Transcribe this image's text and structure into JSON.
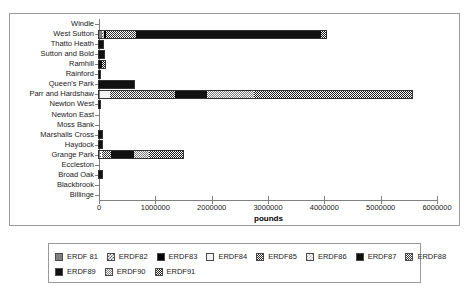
{
  "chart_data": {
    "type": "bar",
    "orientation": "horizontal",
    "stacked": true,
    "title": "",
    "xlabel": "pounds",
    "ylabel": "",
    "xlim": [
      0,
      6000000
    ],
    "xticks": [
      0,
      1000000,
      2000000,
      3000000,
      4000000,
      5000000,
      6000000
    ],
    "xtick_labels": [
      "0",
      "1000000",
      "2000000",
      "3000000",
      "4000000",
      "5000000",
      "6000000"
    ],
    "grid": false,
    "legend_position": "bottom",
    "categories": [
      "Windle",
      "West Sutton",
      "Thatto Heath",
      "Sutton and Bold",
      "Ramhill",
      "Rainford",
      "Queen's Park",
      "Parr and Hardshaw",
      "Newton West",
      "Newton East",
      "Moss Bank",
      "Marshalls Cross",
      "Haydock",
      "Grange Park",
      "Eccleston",
      "Broad Oak",
      "Blackbrook",
      "Billinge"
    ],
    "series": [
      {
        "name": "ERDF 81",
        "fill": "f-erdf81",
        "values": [
          0,
          60000,
          0,
          0,
          0,
          0,
          0,
          20000,
          0,
          0,
          0,
          0,
          0,
          18000,
          0,
          0,
          0,
          0
        ]
      },
      {
        "name": "ERDF82",
        "fill": "f-erdf82",
        "values": [
          0,
          30000,
          0,
          0,
          0,
          0,
          0,
          0,
          0,
          0,
          0,
          0,
          0,
          10000,
          0,
          0,
          0,
          0
        ]
      },
      {
        "name": "ERDF83",
        "fill": "f-erdf83",
        "values": [
          0,
          40000,
          0,
          0,
          0,
          0,
          0,
          0,
          0,
          0,
          0,
          0,
          0,
          0,
          0,
          0,
          0,
          0
        ]
      },
      {
        "name": "ERDF84",
        "fill": "f-erdf84",
        "values": [
          0,
          0,
          0,
          0,
          0,
          0,
          0,
          180000,
          0,
          0,
          0,
          0,
          0,
          25000,
          0,
          0,
          0,
          0
        ]
      },
      {
        "name": "ERDF85",
        "fill": "f-erdf85",
        "values": [
          0,
          250000,
          0,
          0,
          0,
          0,
          0,
          0,
          0,
          0,
          0,
          0,
          0,
          0,
          0,
          0,
          0,
          0
        ]
      },
      {
        "name": "ERDF86",
        "fill": "f-erdf86",
        "values": [
          0,
          0,
          0,
          0,
          0,
          0,
          0,
          0,
          0,
          0,
          0,
          0,
          0,
          0,
          0,
          0,
          0,
          0
        ]
      },
      {
        "name": "ERDF87",
        "fill": "f-erdf87",
        "values": [
          0,
          0,
          0,
          0,
          0,
          0,
          0,
          0,
          0,
          0,
          0,
          0,
          0,
          0,
          0,
          0,
          0,
          0
        ]
      },
      {
        "name": "ERDF88",
        "fill": "f-erdf88",
        "values": [
          0,
          270000,
          0,
          0,
          0,
          0,
          0,
          1150000,
          0,
          0,
          0,
          0,
          0,
          160000,
          0,
          0,
          0,
          0
        ]
      },
      {
        "name": "ERDF89",
        "fill": "f-erdf89",
        "values": [
          0,
          3300000,
          65000,
          90000,
          60000,
          20000,
          620000,
          560000,
          12000,
          0,
          0,
          55000,
          55000,
          400000,
          0,
          60000,
          0,
          0
        ]
      },
      {
        "name": "ERDF90",
        "fill": "f-erdf90",
        "values": [
          0,
          0,
          0,
          0,
          0,
          0,
          0,
          850000,
          0,
          0,
          0,
          0,
          0,
          280000,
          0,
          0,
          0,
          0
        ]
      },
      {
        "name": "ERDF91",
        "fill": "f-erdf91",
        "values": [
          0,
          80000,
          0,
          0,
          50000,
          0,
          0,
          2800000,
          0,
          0,
          0,
          0,
          0,
          590000,
          0,
          0,
          0,
          0
        ]
      }
    ],
    "totals": [
      0,
      4030000,
      65000,
      90000,
      110000,
      20000,
      620000,
      5560000,
      12000,
      0,
      0,
      55000,
      55000,
      1483000,
      0,
      60000,
      0,
      0
    ]
  },
  "legend": {
    "rows": [
      [
        "ERDF 81",
        "ERDF82",
        "ERDF83",
        "ERDF84",
        "ERDF85",
        "ERDF86",
        "ERDF87",
        "ERDF88"
      ],
      [
        "ERDF89",
        "ERDF90",
        "ERDF91"
      ]
    ]
  }
}
